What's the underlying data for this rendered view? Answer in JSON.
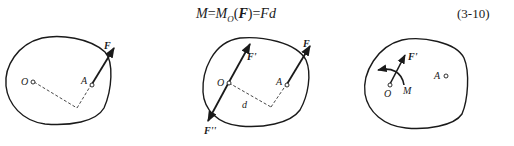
{
  "equation": {
    "lhs": "M",
    "eq1": "=",
    "moment_symbol": "M",
    "moment_subscript": "O",
    "open_paren": "(",
    "force_vector": "F",
    "close_paren": ")",
    "eq2": "=",
    "rhs": "Fd",
    "number": "(3-10)"
  },
  "figures": [
    {
      "id": "figure-a",
      "labels": {
        "point_o": "O",
        "point_a": "A",
        "force": "F"
      }
    },
    {
      "id": "figure-b",
      "labels": {
        "point_o": "O",
        "point_a": "A",
        "force": "F",
        "force_prime": "F'",
        "force_double_prime": "F''",
        "distance": "d"
      }
    },
    {
      "id": "figure-c",
      "labels": {
        "point_o": "O",
        "point_a": "A",
        "force_prime": "F'",
        "moment": "M"
      }
    }
  ],
  "colors": {
    "ink": "#1a1a1a",
    "background": "#ffffff"
  }
}
